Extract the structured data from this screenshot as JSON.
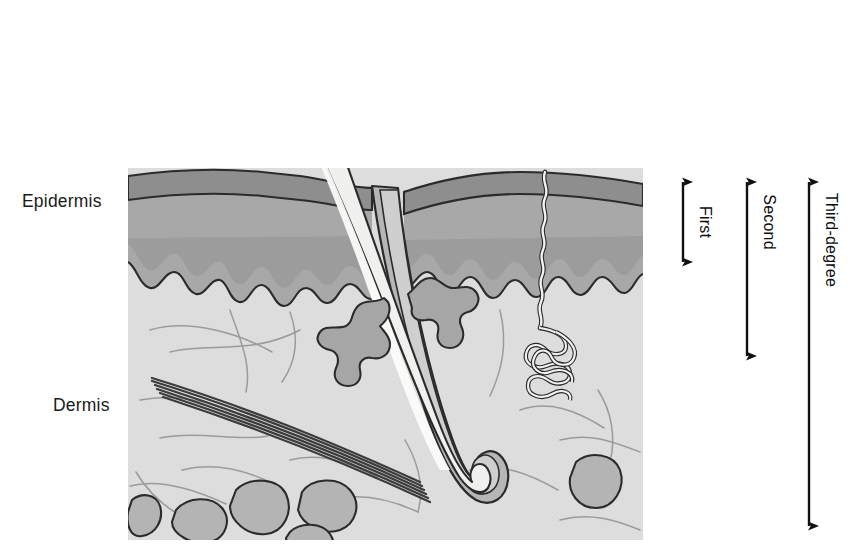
{
  "figure": {
    "kind": "skin-cross-section-burn-depth-diagram",
    "background_color": "#ffffff",
    "panel": {
      "name": "skin-cross-section-panel",
      "x": 128,
      "y": 168,
      "width": 515,
      "height": 372
    }
  },
  "layer_labels": [
    {
      "id": "epidermis",
      "text": "Epidermis",
      "x": 22,
      "y": 207
    },
    {
      "id": "dermis",
      "text": "Dermis",
      "x": 53,
      "y": 411
    }
  ],
  "depth_markers": [
    {
      "id": "first-degree",
      "label": "First",
      "axis_x": 683,
      "top_y": 172,
      "bottom_y": 272,
      "label_x": 700,
      "label_y": 222
    },
    {
      "id": "second-degree",
      "label": "Second",
      "axis_x": 747,
      "top_y": 172,
      "bottom_y": 366,
      "label_x": 764,
      "label_y": 222
    },
    {
      "id": "third-degree",
      "label": "Third-degree",
      "axis_x": 809,
      "top_y": 172,
      "bottom_y": 536,
      "label_x": 826,
      "label_y": 222
    }
  ],
  "anatomy_structures": [
    {
      "id": "stratum-corneum",
      "name": "stratum corneum band",
      "color": "#8e8e8e"
    },
    {
      "id": "epidermis-layer",
      "name": "epidermis layer",
      "color": "#a8a8a8"
    },
    {
      "id": "basal-zone",
      "name": "basal / pigment zone",
      "color": "#9a9a9a"
    },
    {
      "id": "dermis-layer",
      "name": "dermis",
      "color": "#dedede"
    },
    {
      "id": "hair-shaft",
      "name": "hair shaft",
      "color": "#f0f0ee"
    },
    {
      "id": "hair-follicle",
      "name": "hair follicle sheath",
      "color": "#b6b6b6"
    },
    {
      "id": "hair-bulb",
      "name": "hair bulb and dermal papilla",
      "color": "#eeeeec"
    },
    {
      "id": "sebaceous-gland-left",
      "name": "sebaceous gland left",
      "color": "#a6a6a6"
    },
    {
      "id": "sebaceous-gland-right",
      "name": "sebaceous gland right",
      "color": "#a6a6a6"
    },
    {
      "id": "sweat-gland",
      "name": "sweat gland duct and coil",
      "color": "#f2f2f0"
    },
    {
      "id": "arrector-pili-muscle",
      "name": "arrector pili muscle bundle",
      "color": "#3c3c3c"
    },
    {
      "id": "adipose-lobules",
      "name": "subcutaneous fat lobules",
      "color": "#b4b4b4"
    },
    {
      "id": "collagen-fibers",
      "name": "collagen fiber strands",
      "color": "#9b9b9b"
    }
  ],
  "colors": {
    "outline": "#2b2b2b",
    "stratum_corneum": "#8e8e8e",
    "epidermis": "#a8a8a8",
    "basal_zone": "#9a9a9a",
    "dermis": "#dedede",
    "hair_shaft": "#f0f0ee",
    "follicle_sheath": "#b6b6b6",
    "gland": "#a6a6a6",
    "fat": "#b4b4b4",
    "fiber": "#9b9b9b",
    "muscle": "#3c3c3c",
    "text": "#1a1a1a"
  }
}
